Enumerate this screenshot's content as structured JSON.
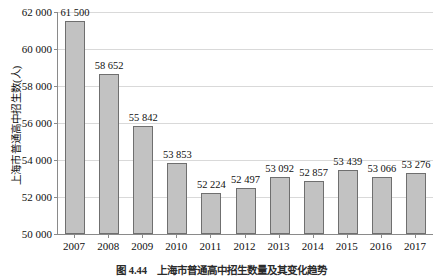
{
  "chart_data": {
    "type": "bar",
    "title": "",
    "caption_number": "图 4.44",
    "caption_text": "上海市普通高中招生数量及其变化趋势",
    "xlabel": "",
    "ylabel": "上海市普通高中招生数(人)",
    "categories": [
      "2007",
      "2008",
      "2009",
      "2010",
      "2011",
      "2012",
      "2013",
      "2014",
      "2015",
      "2016",
      "2017"
    ],
    "values": [
      61500,
      58652,
      55842,
      53853,
      52224,
      52497,
      53092,
      52857,
      53439,
      53066,
      53276
    ],
    "value_labels": [
      "61 500",
      "58 652",
      "55 842",
      "53 853",
      "52 224",
      "52 497",
      "53 092",
      "52 857",
      "53 439",
      "53 066",
      "53 276"
    ],
    "ylim": [
      50000,
      62000
    ],
    "ytick_values": [
      50000,
      52000,
      54000,
      56000,
      58000,
      60000,
      62000
    ],
    "ytick_labels": [
      "50 000",
      "52 000",
      "54 000",
      "56 000",
      "58 000",
      "60 000",
      "62 000"
    ],
    "grid": true,
    "legend": "none",
    "bar_color": "#c2c2c2",
    "bar_edge_color": "#6f6f6f",
    "grid_color": "#d9d9d9",
    "axis_color": "#8a8a8a"
  }
}
